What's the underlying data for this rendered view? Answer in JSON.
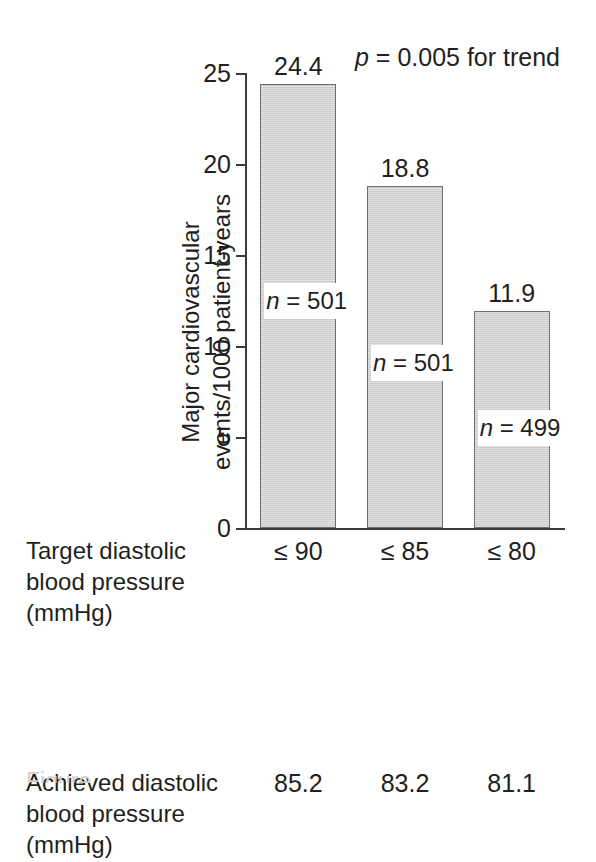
{
  "chart_data": {
    "type": "bar",
    "title": "",
    "xlabel": "",
    "ylabel": "Major cardiovascular events/1000 patient-years",
    "ylabel_lines": [
      "Major cardiovascular",
      "events/1000 patient-years"
    ],
    "ylim": [
      0,
      25
    ],
    "yticks": [
      0,
      5,
      10,
      15,
      20,
      25
    ],
    "ytick_labels": [
      "0",
      "5",
      "10",
      "15",
      "20",
      "25"
    ],
    "grid": false,
    "legend": "none",
    "categories": [
      "≤ 90",
      "≤ 85",
      "≤ 80"
    ],
    "values": [
      24.4,
      18.8,
      11.9
    ],
    "value_labels": [
      "24.4",
      "18.8",
      "11.9"
    ],
    "group_sizes": [
      "n = 501",
      "n = 501",
      "n = 499"
    ],
    "group_size_values": [
      501,
      501,
      499
    ],
    "group_size_prefix": "n",
    "group_size_eq": " = ",
    "annotation": {
      "p_symbol": "p",
      "p_text": " = 0.005 for trend",
      "full": "p = 0.005 for trend"
    },
    "bar_color": "#d2d2d2",
    "bar_edge_color": "#6d6d6d",
    "text_color": "#231f20",
    "background": "#ffffff"
  },
  "bottom_table": {
    "rows": [
      {
        "label_lines": [
          "Target diastolic",
          "blood pressure",
          "(mmHg)"
        ],
        "cells": [
          "≤ 90",
          "≤ 85",
          "≤ 80"
        ]
      },
      {
        "label_lines": [
          "Achieved diastolic",
          "blood pressure",
          "(mmHg)"
        ],
        "cells": [
          "85.2",
          "83.2",
          "81.1"
        ]
      }
    ]
  },
  "caption": {
    "cut_off_text": "Figure"
  }
}
